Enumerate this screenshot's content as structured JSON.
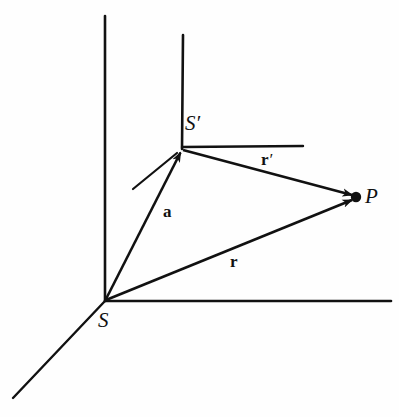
{
  "figure": {
    "kind": "vector-geometry-diagram",
    "background_color": "#fefefe",
    "stroke_color": "#111111",
    "width": 399,
    "height": 417,
    "caption": "",
    "points": [
      {
        "id": "S",
        "label": "S",
        "prime": "",
        "x": 105,
        "y": 301,
        "label_x": 98,
        "label_y": 310
      },
      {
        "id": "Sprime",
        "label": "S",
        "prime": "′",
        "x": 182,
        "y": 148,
        "label_x": 185,
        "label_y": 113
      },
      {
        "id": "P",
        "label": "P",
        "prime": "",
        "x": 356,
        "y": 197,
        "label_x": 365,
        "label_y": 186
      }
    ],
    "vectors": [
      {
        "id": "a",
        "label": "a",
        "prime": "",
        "from": "S",
        "to": "Sprime",
        "label_x": 163,
        "label_y": 203
      },
      {
        "id": "rprime",
        "label": "r",
        "prime": "′",
        "from": "Sprime",
        "to": "P",
        "label_x": 261,
        "label_y": 151
      },
      {
        "id": "r",
        "label": "r",
        "prime": "",
        "from": "S",
        "to": "P",
        "label_x": 230,
        "label_y": 253
      }
    ],
    "axes": [
      {
        "id": "S-axis-vertical",
        "x1": 105,
        "y1": 301,
        "x2": 105,
        "y2": 16
      },
      {
        "id": "S-axis-horizontal",
        "x1": 105,
        "y1": 301,
        "x2": 391,
        "y2": 301
      },
      {
        "id": "S-axis-diagonal",
        "x1": 105,
        "y1": 301,
        "x2": 13,
        "y2": 398
      },
      {
        "id": "Sprime-axis-vertical",
        "x1": 182,
        "y1": 148,
        "x2": 183,
        "y2": 35
      },
      {
        "id": "Sprime-axis-horizontal",
        "x1": 182,
        "y1": 147,
        "x2": 303,
        "y2": 146
      },
      {
        "id": "Sprime-axis-diagonal",
        "x1": 177,
        "y1": 152,
        "x2": 133,
        "y2": 189
      }
    ]
  }
}
